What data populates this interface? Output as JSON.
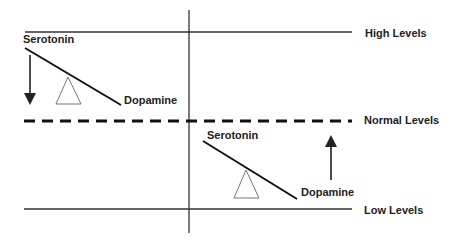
{
  "levels": {
    "high": "High Levels",
    "normal": "Normal Levels",
    "low": "Low Levels"
  },
  "left_seesaw": {
    "high_end_label": "Serotonin",
    "low_end_label": "Dopamine",
    "arrow_direction": "down"
  },
  "right_seesaw": {
    "high_end_label": "Serotonin",
    "low_end_label": "Dopamine",
    "arrow_direction": "up"
  },
  "colors": {
    "line": "#222222",
    "background": "#ffffff",
    "fulcrum": "#666666"
  }
}
